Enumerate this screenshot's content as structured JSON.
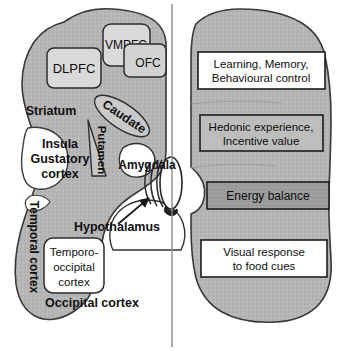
{
  "figure": {
    "type": "anatomical-schematic",
    "midline_label": "hemisphere-midline"
  },
  "colors": {
    "brain_fill": "#b5b5b5",
    "brain_stroke": "#333333",
    "light_box_fill": "#d7d7d7",
    "white_box_fill": "#ffffff",
    "shaded_box_fill": "#b5b5b5",
    "dark_box_fill": "#9a9a9a",
    "text": "#101010",
    "background": "#ffffff"
  },
  "left_hemisphere": {
    "name": "left-brain-schematic",
    "region_labels": [
      {
        "id": "striatum",
        "text": "Striatum"
      },
      {
        "id": "caudate",
        "text": "Caudate"
      },
      {
        "id": "putamen",
        "text": "Putamen"
      },
      {
        "id": "amygdala",
        "text": "Amygdala"
      },
      {
        "id": "hypothalamus",
        "text": "Hypothalamus"
      },
      {
        "id": "temporal-cortex",
        "text": "Temporal cortex"
      },
      {
        "id": "occipital-cortex",
        "text": "Occipital cortex"
      }
    ],
    "insula_label": {
      "id": "insula-gustatory-cortex",
      "line1": "Insula",
      "line2": "Gustatory",
      "line3": "cortex"
    },
    "region_boxes": [
      {
        "id": "dlpfc",
        "text": "DLPFC"
      },
      {
        "id": "vmpfc",
        "text": "VMPFC"
      },
      {
        "id": "ofc",
        "text": "OFC"
      },
      {
        "id": "temporo-occipital",
        "line1": "Temporo-",
        "line2": "occipital",
        "line3": "cortex"
      }
    ]
  },
  "right_hemisphere": {
    "name": "right-brain-schematic",
    "function_boxes": [
      {
        "id": "learning-memory-box",
        "line1": "Learning, Memory,",
        "line2": "Behavioural control",
        "fill": "white"
      },
      {
        "id": "hedonic-experience-box",
        "line1": "Hedonic experience,",
        "line2": "Incentive value",
        "fill": "shaded"
      },
      {
        "id": "energy-balance-box",
        "line1": "Energy balance",
        "line2": "",
        "fill": "dark"
      },
      {
        "id": "visual-response-box",
        "line1": "Visual response",
        "line2": "to food cues",
        "fill": "white"
      }
    ]
  },
  "annotations": {
    "hypothalamus_arrow": "arrow pointing from Hypothalamus label to midline hypothalamic structure"
  }
}
